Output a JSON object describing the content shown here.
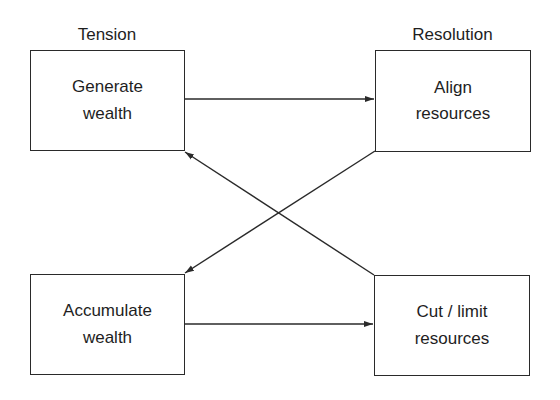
{
  "columns": {
    "left_title": "Tension",
    "right_title": "Resolution"
  },
  "nodes": {
    "generate": {
      "line1": "Generate",
      "line2": "wealth"
    },
    "align": {
      "line1": "Align",
      "line2": "resources"
    },
    "accumulate": {
      "line1": "Accumulate",
      "line2": "wealth"
    },
    "cut": {
      "line1": "Cut / limit",
      "line2": "resources"
    }
  },
  "edges": [
    {
      "from": "Generate wealth",
      "to": "Align resources"
    },
    {
      "from": "Align resources",
      "to": "Accumulate wealth"
    },
    {
      "from": "Accumulate wealth",
      "to": "Cut / limit resources"
    },
    {
      "from": "Cut / limit resources",
      "to": "Generate wealth"
    }
  ],
  "colors": {
    "line": "#2a2a2a",
    "text": "#1e1e1e",
    "background": "#ffffff"
  }
}
